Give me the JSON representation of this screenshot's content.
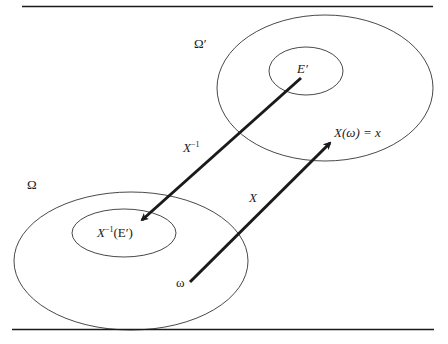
{
  "diagram": {
    "type": "set-mapping",
    "spaces": [
      {
        "id": "omega_prime",
        "label": "Ω′",
        "inner_set": {
          "label": "E′"
        }
      },
      {
        "id": "omega",
        "label": "Ω",
        "inner_set": {
          "label_main": "X",
          "label_sup": "-1",
          "label_arg": "(E′)"
        }
      }
    ],
    "points": [
      {
        "id": "omega_point",
        "label": "ω"
      },
      {
        "id": "image_point",
        "label": "X(ω) = x"
      }
    ],
    "arrows": [
      {
        "id": "inverse_map",
        "label_main": "X",
        "label_sup": "-1",
        "from": "E′",
        "to": "X⁻¹(E′)"
      },
      {
        "id": "forward_map",
        "label": "X",
        "from": "ω",
        "to": "X(ω) = x"
      }
    ]
  },
  "labels": {
    "omega_prime": "Ω′",
    "e_prime": "E′",
    "image_point": "X(ω) = x",
    "inverse_arrow_main": "X",
    "inverse_arrow_sup": "−1",
    "omega": "Ω",
    "forward_arrow": "X",
    "preimage_main": "X",
    "preimage_sup": "−1",
    "preimage_arg": "(E′)",
    "omega_point": "ω"
  },
  "colors": {
    "stroke": "#1a1a1a",
    "background": "#ffffff"
  }
}
